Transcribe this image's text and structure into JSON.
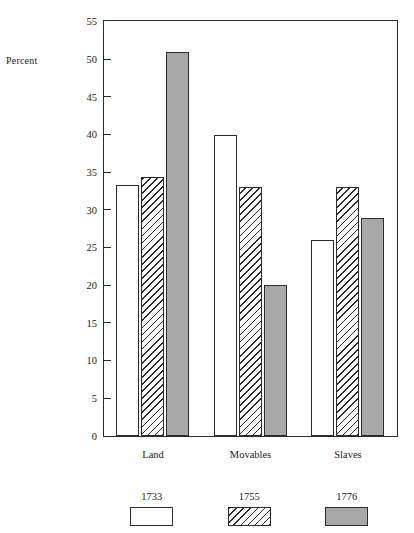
{
  "chart_data": {
    "type": "bar",
    "title": "",
    "xlabel": "",
    "ylabel": "Percent",
    "ylim": [
      0,
      55
    ],
    "yticks": [
      0,
      5,
      10,
      15,
      20,
      25,
      30,
      35,
      40,
      45,
      50,
      55
    ],
    "grid": false,
    "legend_position": "bottom",
    "categories": [
      "Land",
      "Movables",
      "Slaves"
    ],
    "series": [
      {
        "name": "1733",
        "fill": "open",
        "values": [
          33.3,
          40.0,
          26.0
        ]
      },
      {
        "name": "1755",
        "fill": "hatch",
        "values": [
          34.4,
          33.0,
          33.0
        ]
      },
      {
        "name": "1776",
        "fill": "solid",
        "values": [
          51.0,
          20.0,
          29.0
        ]
      }
    ],
    "colors": {
      "open": "#ffffff",
      "hatch": "#ffffff",
      "solid": "#a8a8a8",
      "outline": "#2b2b2b",
      "text": "#1a1a1a",
      "background": "#ffffff"
    }
  },
  "axis": {
    "y_title": "Percent",
    "y_tick_labels": [
      "55",
      "50",
      "45",
      "40",
      "35",
      "30",
      "25",
      "20",
      "15",
      "10",
      "5",
      "0"
    ],
    "x_tick_labels": [
      "Land",
      "Movables",
      "Slaves"
    ]
  },
  "legend": {
    "items": [
      {
        "label": "1733",
        "fill": "open"
      },
      {
        "label": "1755",
        "fill": "hatch"
      },
      {
        "label": "1776",
        "fill": "solid"
      }
    ]
  }
}
